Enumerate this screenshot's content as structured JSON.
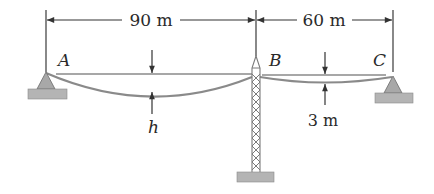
{
  "figure": {
    "type": "cable-tower-diagram",
    "points": [
      {
        "id": "A",
        "label": "A"
      },
      {
        "id": "B",
        "label": "B"
      },
      {
        "id": "C",
        "label": "C"
      }
    ],
    "dimensions": {
      "span_AB": "90 m",
      "span_BC": "60 m",
      "sag_AB": "h",
      "sag_BC": "3 m"
    },
    "colors": {
      "cable": "#8a8a8a",
      "support_fill": "#a8a8a8",
      "ground_fill": "#b4b4b4",
      "line": "#3a3a3a"
    }
  }
}
